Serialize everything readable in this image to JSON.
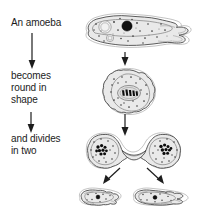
{
  "figure": {
    "background_color": "#ffffff",
    "width": 198,
    "height": 222
  },
  "captions": [
    {
      "id": "cap-1",
      "text": "An amoeba"
    },
    {
      "id": "cap-2",
      "text": "becomes\nround in\nshape"
    },
    {
      "id": "cap-3",
      "text": "and divides\nin two"
    }
  ],
  "stages": [
    {
      "name": "stage-1-feeding-amoeba",
      "label": "An amoeba",
      "shape": "elongated with pseudopods",
      "nucleus": "single dark round nucleus",
      "count": 1
    },
    {
      "name": "stage-2-rounded-amoeba",
      "label": "becomes round in shape",
      "shape": "rounded",
      "nucleus": "central nucleus with condensed chromosomes",
      "count": 1
    },
    {
      "name": "stage-3-dividing-amoeba",
      "label": "and divides in two",
      "shape": "dumbbell, constricted middle",
      "nucleus": "two chromosome clusters",
      "count": 1
    },
    {
      "name": "stage-4-daughter-amoebae",
      "label": "two daughter amoebae",
      "shape": "two separate amoebae with pseudopods",
      "nucleus": "one nucleus each",
      "count": 2
    }
  ],
  "arrows": [
    {
      "name": "text-arrow-1",
      "direction": "down"
    },
    {
      "name": "text-arrow-2",
      "direction": "down"
    },
    {
      "name": "stage-arrow-1",
      "direction": "down"
    },
    {
      "name": "stage-arrow-2",
      "direction": "down"
    },
    {
      "name": "split-arrow-left",
      "direction": "down-left"
    },
    {
      "name": "split-arrow-right",
      "direction": "down-right"
    }
  ],
  "colors": {
    "ink": "#1d1d1d",
    "cell_fill": "#e9e9e9",
    "cell_outline": "#4a4a4a",
    "nucleus": "#101010"
  }
}
